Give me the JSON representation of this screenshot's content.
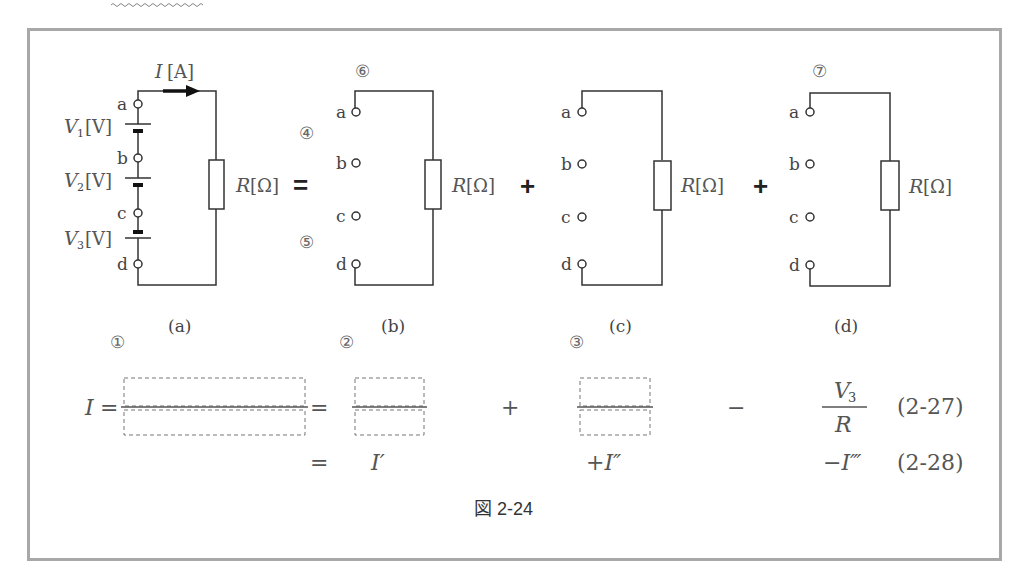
{
  "figure": {
    "caption": "図 2-24",
    "circuits": [
      {
        "id": "a",
        "label": "(a)",
        "current_label": "I[A]",
        "current_italic": "I",
        "current_unit": "[A]",
        "resistor_label_italic": "R",
        "resistor_label_unit": "[Ω]",
        "terminals": [
          "a",
          "b",
          "c",
          "d"
        ],
        "sources": [
          {
            "name": "V1",
            "symbol": "V",
            "sub": "1",
            "unit": "[V]",
            "between": "a-b",
            "polarity": "long-top"
          },
          {
            "name": "V2",
            "symbol": "V",
            "sub": "2",
            "unit": "[V]",
            "between": "b-c",
            "polarity": "long-top"
          },
          {
            "name": "V3",
            "symbol": "V",
            "sub": "3",
            "unit": "[V]",
            "between": "c-d",
            "polarity": "short-top"
          }
        ]
      },
      {
        "id": "b",
        "label": "(b)",
        "resistor_label_italic": "R",
        "resistor_label_unit": "[Ω]",
        "terminals": [
          "a",
          "b",
          "c",
          "d"
        ],
        "blanks": [
          "④",
          "⑤",
          "⑥"
        ]
      },
      {
        "id": "c",
        "label": "(c)",
        "resistor_label_italic": "R",
        "resistor_label_unit": "[Ω]",
        "terminals": [
          "a",
          "b",
          "c",
          "d"
        ]
      },
      {
        "id": "d",
        "label": "(d)",
        "resistor_label_italic": "R",
        "resistor_label_unit": "[Ω]",
        "terminals": [
          "a",
          "b",
          "c",
          "d"
        ],
        "blanks": [
          "⑦"
        ]
      }
    ],
    "operators": {
      "eq": "=",
      "plus1": "+",
      "plus2": "+"
    },
    "blank_markers": {
      "b1": "①",
      "b2": "②",
      "b3": "③",
      "b4": "④",
      "b5": "⑤",
      "b6": "⑥",
      "b7": "⑦"
    },
    "equations": {
      "eq1": {
        "lhs": "I",
        "eq_sign": "=",
        "eq_sign2": "=",
        "plus": "+",
        "minus": "−",
        "frac_num_symbol": "V",
        "frac_num_sub": "3",
        "frac_den": "R",
        "number": "(2-27)"
      },
      "eq2": {
        "eq_sign": "=",
        "term1": "I′",
        "term2": "+I″",
        "term3": "−I‴",
        "number": "(2-28)"
      }
    }
  }
}
